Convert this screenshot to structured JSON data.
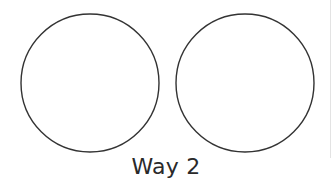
{
  "caption": "Way 2",
  "colors": {
    "background": "#ffffff",
    "stroke": "#333333",
    "text": "#2a2a2a",
    "edge_line": "#e3e3e3"
  },
  "shapes": [
    {
      "type": "circle",
      "cx": 90,
      "cy": 83,
      "r": 69,
      "fill": "none"
    },
    {
      "type": "circle",
      "cx": 245,
      "cy": 83,
      "r": 69,
      "fill": "none"
    }
  ]
}
